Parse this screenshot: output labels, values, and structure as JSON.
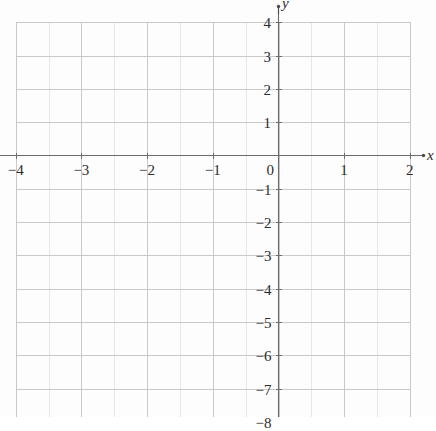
{
  "figure": {
    "kind": "cartesian-coordinate-grid",
    "background_color": "#fdfdfd",
    "minor_grid_color": "#e8e8ea",
    "major_grid_color": "#c9c9cd",
    "axis_color": "#6b6b70",
    "label_color": "#2b2b2b"
  },
  "axes": {
    "x_axis_label": "x",
    "y_axis_label": "y",
    "x_ticks": [
      {
        "value": -4,
        "label": "−4"
      },
      {
        "value": -3,
        "label": "−3"
      },
      {
        "value": -2,
        "label": "−2"
      },
      {
        "value": -1,
        "label": "−1"
      },
      {
        "value": 0,
        "label": "0"
      },
      {
        "value": 1,
        "label": "1"
      },
      {
        "value": 2,
        "label": "2"
      }
    ],
    "y_ticks": [
      {
        "value": 4,
        "label": "4"
      },
      {
        "value": 3,
        "label": "3"
      },
      {
        "value": 2,
        "label": "2"
      },
      {
        "value": 1,
        "label": "1"
      },
      {
        "value": -1,
        "label": "−1"
      },
      {
        "value": -2,
        "label": "−2"
      },
      {
        "value": -3,
        "label": "−3"
      },
      {
        "value": -4,
        "label": "−4"
      },
      {
        "value": -5,
        "label": "−5"
      },
      {
        "value": -6,
        "label": "−6"
      },
      {
        "value": -7,
        "label": "−7"
      },
      {
        "value": -8,
        "label": "−8"
      }
    ]
  },
  "chart_data": {
    "type": "scatter",
    "title": "",
    "subtitle": "",
    "xlabel": "x",
    "ylabel": "y",
    "xlim": [
      -4,
      2
    ],
    "ylim": [
      -8,
      4.3
    ],
    "x_ticks": [
      -4,
      -3,
      -2,
      -1,
      0,
      1,
      2
    ],
    "y_ticks": [
      4,
      3,
      2,
      1,
      -1,
      -2,
      -3,
      -4,
      -5,
      -6,
      -7,
      -8
    ],
    "x_tick_labels": [
      "−4",
      "−3",
      "−2",
      "−1",
      "0",
      "1",
      "2"
    ],
    "y_tick_labels": [
      "4",
      "3",
      "2",
      "1",
      "−1",
      "−2",
      "−3",
      "−4",
      "−5",
      "−6",
      "−7",
      "−8"
    ],
    "grid": true,
    "grid_spacing_x": 0.5,
    "grid_spacing_y": 1,
    "legend": null,
    "legend_position": null,
    "series": [],
    "values": [],
    "categories": [],
    "annotations": []
  }
}
